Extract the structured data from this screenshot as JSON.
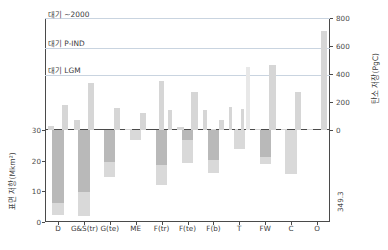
{
  "chart_data": {
    "type": "bar",
    "title": "",
    "categories": [
      "D",
      "G&S(tr)",
      "G(te)",
      "ME",
      "F(tr)",
      "F(te)",
      "F(b)",
      "T",
      "FW",
      "C",
      "O"
    ],
    "panels": [
      {
        "name": "carbon-storage",
        "ylabel": "탄소 저장(PgC)",
        "axis_side": "right",
        "ylim": [
          0,
          800
        ],
        "yticks": [
          0,
          200,
          400,
          600,
          800
        ],
        "values": [
          30,
          180,
          70,
          335,
          0,
          160,
          10,
          120,
          0,
          350,
          140,
          25,
          270,
          145,
          10,
          70,
          165,
          5,
          150,
          450,
          5,
          465,
          10,
          270,
          5,
          710
        ],
        "series": [
          {
            "name": "carbon",
            "values": [
              30,
              180,
              70,
              335,
              0,
              160,
              10,
              120,
              0,
              350,
              140,
              25,
              270,
              145,
              10,
              70,
              165,
              5,
              150,
              450,
              5,
              465,
              10,
              270,
              5,
              710
            ]
          }
        ]
      },
      {
        "name": "surface-area",
        "ylabel": "표면 저항(Mkm²)",
        "axis_side": "left",
        "ylim": [
          0,
          30
        ],
        "yticks": [
          0,
          10,
          20,
          30
        ],
        "values": [
          27.8,
          28.0,
          15.2,
          3.1,
          18.0,
          10.8,
          14.0,
          6.3,
          11.0,
          14.2,
          0
        ],
        "lower_segment": [
          4.0,
          7.7,
          4.8,
          3.1,
          6.7,
          7.6,
          4.1,
          6.3,
          2.2,
          14.2,
          0
        ]
      }
    ],
    "gridlines": [
      {
        "label": "대기 ~2000",
        "value": 800
      },
      {
        "label": "대기 P-IND",
        "value": 589
      },
      {
        "label": "대기 LGM",
        "value": 390
      }
    ],
    "annotations": [
      {
        "text": "349.3",
        "near_category": "O"
      }
    ],
    "grid": true,
    "legend_position": "none",
    "colors": {
      "bar_upper": "#d6d6d6",
      "bar_upper_highlight": "#e8e8e8",
      "bar_lower_top": "#b9b9b9",
      "bar_lower_bottom": "#d9d9d9",
      "gridline": "#c9d4e0",
      "axis": "#4a4a4a"
    }
  },
  "axes": {
    "left": {
      "title": "표면 저항(Mkm²)",
      "ticks": [
        "30",
        "20",
        "10",
        "0"
      ]
    },
    "right": {
      "title": "탄소 저장(PgC)",
      "ticks": [
        "800",
        "600",
        "400",
        "200",
        "0"
      ]
    },
    "bottom": {
      "ticks": [
        "D",
        "G&S(tr)",
        "G(te)",
        "ME",
        "F(tr)",
        "F(te)",
        "F(b)",
        "T",
        "FW",
        "C",
        "O"
      ]
    }
  },
  "notes": {
    "line_2000": "대기 ~2000",
    "line_pind": "대기 P-IND",
    "line_lgm": "대기 LGM",
    "value_349": "349.3"
  }
}
